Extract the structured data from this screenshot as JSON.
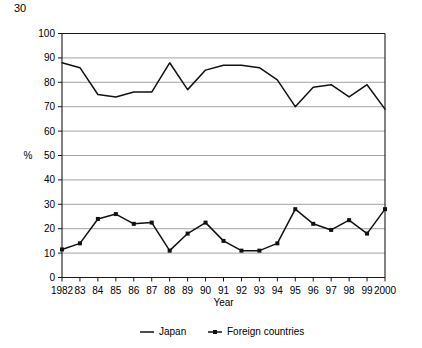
{
  "figure_number": "30",
  "chart_data": {
    "type": "line",
    "title": "",
    "xlabel": "Year",
    "ylabel": "%",
    "ylim": [
      0,
      100
    ],
    "ytick_step": 10,
    "yticks": [
      "0",
      "10",
      "20",
      "30",
      "40",
      "50",
      "60",
      "70",
      "80",
      "90",
      "100"
    ],
    "grid": true,
    "grid_axis": "y",
    "legend_position": "bottom",
    "categories": [
      "1982",
      "83",
      "84",
      "85",
      "86",
      "87",
      "88",
      "89",
      "90",
      "91",
      "92",
      "93",
      "94",
      "95",
      "96",
      "97",
      "98",
      "99",
      "2000"
    ],
    "x": [
      1982,
      1983,
      1984,
      1985,
      1986,
      1987,
      1988,
      1989,
      1990,
      1991,
      1992,
      1993,
      1994,
      1995,
      1996,
      1997,
      1998,
      1999,
      2000
    ],
    "xtick_labels": [
      "1982",
      "83",
      "84",
      "85",
      "86",
      "87",
      "88",
      "89",
      "90",
      "91",
      "92",
      "93",
      "94",
      "95",
      "96",
      "97",
      "98",
      "99",
      "2000"
    ],
    "series": [
      {
        "name": "Japan",
        "marker": "none",
        "color": "#111111",
        "values": [
          88,
          86,
          75,
          74,
          76,
          76,
          88,
          77,
          85,
          87,
          87,
          86,
          81,
          70,
          78,
          79,
          74,
          79,
          69
        ]
      },
      {
        "name": "Foreign countries",
        "marker": "square",
        "color": "#111111",
        "values": [
          11.5,
          14,
          24,
          26,
          22,
          22.5,
          11,
          18,
          22.5,
          15,
          11,
          11,
          14,
          28,
          22,
          19.5,
          23.5,
          18,
          28
        ]
      }
    ],
    "legend": [
      "Japan",
      "Foreign countries"
    ]
  }
}
